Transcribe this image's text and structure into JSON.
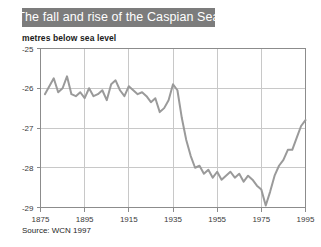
{
  "title": "The fall and rise of the Caspian Sea",
  "axis_title": "metres below sea level",
  "source": "Source: WCN 1997",
  "colors": {
    "title_bar_bg": "#7c7c7c",
    "title_text": "#ffffff",
    "line": "#9a9a9a",
    "grid": "#c8c8c8",
    "axis": "#8c8c8c",
    "tick_text": "#3a3a3a",
    "background": "#ffffff"
  },
  "chart_data": {
    "type": "line",
    "title": "The fall and rise of the Caspian Sea",
    "xlabel": "",
    "ylabel": "metres below sea level",
    "xlim": [
      1875,
      1995
    ],
    "ylim": [
      -29,
      -25
    ],
    "grid": true,
    "legend": "none",
    "xticks": [
      1875,
      1895,
      1915,
      1935,
      1955,
      1975,
      1995
    ],
    "yticks": [
      -25,
      -26,
      -27,
      -28,
      -29
    ],
    "ytick_labels": [
      "-25",
      "-26",
      "-27",
      "-28",
      "-29"
    ],
    "xtick_labels": [
      "1875",
      "1895",
      "1915",
      "1935",
      "1955",
      "1975",
      "1995"
    ],
    "series": [
      {
        "name": "Caspian Sea level",
        "x": [
          1877,
          1879,
          1881,
          1883,
          1885,
          1887,
          1889,
          1891,
          1893,
          1895,
          1897,
          1899,
          1901,
          1903,
          1905,
          1907,
          1909,
          1911,
          1913,
          1915,
          1917,
          1919,
          1921,
          1923,
          1925,
          1927,
          1929,
          1931,
          1933,
          1935,
          1937,
          1939,
          1941,
          1943,
          1945,
          1947,
          1949,
          1951,
          1953,
          1955,
          1957,
          1959,
          1961,
          1963,
          1965,
          1967,
          1969,
          1971,
          1973,
          1975,
          1977,
          1979,
          1981,
          1983,
          1985,
          1987,
          1989,
          1991,
          1993,
          1995
        ],
        "values": [
          -26.15,
          -25.95,
          -25.75,
          -26.1,
          -26.0,
          -25.7,
          -26.15,
          -26.2,
          -26.1,
          -26.25,
          -26.0,
          -26.2,
          -26.15,
          -26.05,
          -26.3,
          -25.9,
          -25.8,
          -26.05,
          -26.2,
          -25.95,
          -26.05,
          -26.15,
          -26.1,
          -26.2,
          -26.35,
          -26.25,
          -26.6,
          -26.5,
          -26.3,
          -25.9,
          -26.05,
          -26.75,
          -27.3,
          -27.7,
          -28.0,
          -27.95,
          -28.15,
          -28.05,
          -28.25,
          -28.1,
          -28.3,
          -28.2,
          -28.1,
          -28.25,
          -28.15,
          -28.35,
          -28.2,
          -28.3,
          -28.45,
          -28.55,
          -28.95,
          -28.6,
          -28.2,
          -27.95,
          -27.8,
          -27.55,
          -27.55,
          -27.25,
          -26.95,
          -26.8
        ]
      }
    ]
  }
}
